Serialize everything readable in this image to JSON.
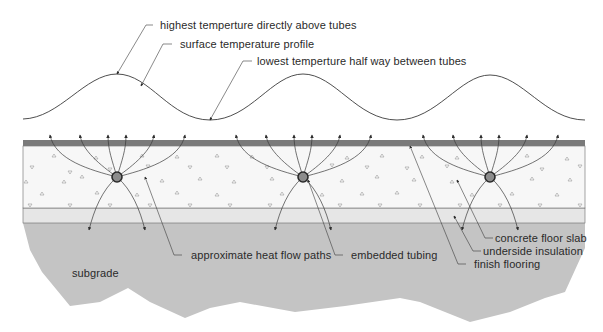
{
  "colors": {
    "background": "#ffffff",
    "flooring": "#7a7a7a",
    "concrete": "#f7f7f7",
    "insulation": "#e6e6e6",
    "subgrade": "#c4c4c4",
    "line": "#3a3a3a",
    "tube_fill": "#8c8c8c",
    "text": "#2a2a2a"
  },
  "labels": {
    "highest_temp": "highest temperture directly above tubes",
    "surface_profile": "surface temperature profile",
    "lowest_temp": "lowest temperture half way between tubes",
    "heat_flow": "approximate heat flow paths",
    "tubing": "embedded tubing",
    "slab": "concrete floor slab",
    "insulation": "underside insulation",
    "flooring": "finish flooring",
    "subgrade": "subgrade"
  },
  "tubes": [
    {
      "x": 117,
      "y": 177
    },
    {
      "x": 303,
      "y": 177
    },
    {
      "x": 490,
      "y": 177
    }
  ]
}
